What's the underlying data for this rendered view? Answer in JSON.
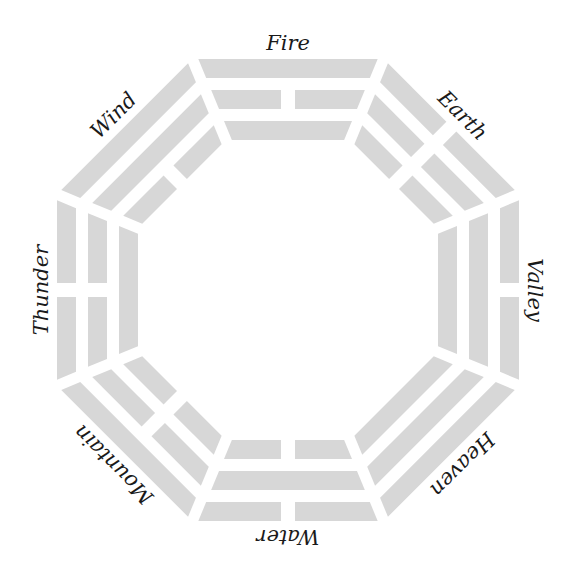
{
  "diagram": {
    "center": [
      288,
      290
    ],
    "bar_color": "#d7d7d7",
    "text_color": "#1a1a1a",
    "trigrams": [
      {
        "label": "Fire",
        "angle": 0,
        "lines_outer_to_inner": [
          "solid",
          "broken",
          "solid"
        ]
      },
      {
        "label": "Earth",
        "angle": 45,
        "lines_outer_to_inner": [
          "broken",
          "broken",
          "broken"
        ]
      },
      {
        "label": "Valley",
        "angle": 90,
        "lines_outer_to_inner": [
          "broken",
          "solid",
          "solid"
        ]
      },
      {
        "label": "Heaven",
        "angle": 135,
        "lines_outer_to_inner": [
          "solid",
          "solid",
          "solid"
        ]
      },
      {
        "label": "Water",
        "angle": 180,
        "lines_outer_to_inner": [
          "broken",
          "solid",
          "broken"
        ]
      },
      {
        "label": "Mountain",
        "angle": 225,
        "lines_outer_to_inner": [
          "solid",
          "broken",
          "broken"
        ]
      },
      {
        "label": "Thunder",
        "angle": 270,
        "lines_outer_to_inner": [
          "broken",
          "broken",
          "solid"
        ]
      },
      {
        "label": "Wind",
        "angle": 315,
        "lines_outer_to_inner": [
          "solid",
          "solid",
          "broken"
        ]
      }
    ]
  }
}
